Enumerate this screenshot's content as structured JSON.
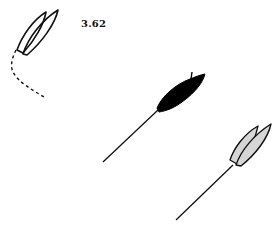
{
  "figure": {
    "label": "3.62",
    "colors": {
      "stroke": "#111111",
      "background": "#ffffff",
      "solid_fill": "#000000",
      "gray_fill": "#d6d6d6"
    },
    "boats": [
      {
        "id": "boat-1",
        "style": "outline",
        "description": "two overlapping hull outlines",
        "path_trail": "dashed"
      },
      {
        "id": "boat-2",
        "style": "solid-black",
        "description": "filled black hull",
        "path_trail": "solid"
      },
      {
        "id": "boat-3",
        "style": "gray-filled",
        "description": "two overlapping gray hulls",
        "path_trail": "solid"
      }
    ]
  }
}
